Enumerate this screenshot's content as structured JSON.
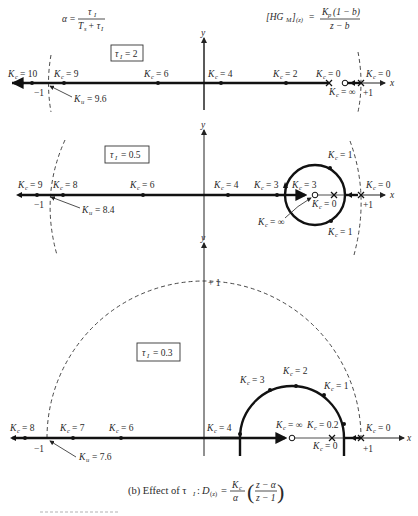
{
  "header": {
    "alpha_formula": {
      "lhs": "α =",
      "num": "τ",
      "num_sub": "I",
      "den": "T",
      "den_sub": "s",
      "den_plus": "+ τ",
      "den_sub2": "I"
    },
    "plant_formula": {
      "lhs": "[HG",
      "lhs_sub": "M",
      "lhs_close": "]",
      "lhs_sub2": "(z)",
      "eq": "=",
      "num": "K",
      "num_sub": "p",
      "num_rest": "(1 − b)",
      "den": "z − b"
    }
  },
  "axis_labels": {
    "x": "x",
    "y": "y",
    "minus_one": "−1",
    "plus_one": "+1"
  },
  "panels": [
    {
      "id": "tau-2",
      "tau_label": "τ",
      "tau_sub": "I",
      "tau_value": "= 2",
      "points": [
        {
          "label": "K",
          "sub": "c",
          "value": "= 10"
        },
        {
          "label": "K",
          "sub": "c",
          "value": "= 9"
        },
        {
          "label": "K",
          "sub": "c",
          "value": "= 6"
        },
        {
          "label": "K",
          "sub": "c",
          "value": "= 4"
        },
        {
          "label": "K",
          "sub": "c",
          "value": "= 2"
        },
        {
          "label": "K",
          "sub": "c",
          "value": "= 0"
        },
        {
          "label": "K",
          "sub": "c",
          "value": "= 0"
        },
        {
          "label": "K",
          "sub": "c",
          "value": "= ∞"
        }
      ],
      "ultimate": {
        "label": "K",
        "sub": "u",
        "value": "= 9.6"
      }
    },
    {
      "id": "tau-0.5",
      "tau_label": "τ",
      "tau_sub": "I",
      "tau_value": "= 0.5",
      "points": [
        {
          "label": "K",
          "sub": "c",
          "value": "= 9"
        },
        {
          "label": "K",
          "sub": "c",
          "value": "= 8"
        },
        {
          "label": "K",
          "sub": "c",
          "value": "= 6"
        },
        {
          "label": "K",
          "sub": "c",
          "value": "= 4"
        },
        {
          "label": "K",
          "sub": "c",
          "value": "= 3"
        },
        {
          "label": "K",
          "sub": "c",
          "value": "= 3"
        },
        {
          "label": "K",
          "sub": "c",
          "value": "= 1"
        },
        {
          "label": "K",
          "sub": "c",
          "value": "= 0"
        },
        {
          "label": "K",
          "sub": "c",
          "value": "= 0"
        },
        {
          "label": "K",
          "sub": "c",
          "value": "= 1"
        },
        {
          "label": "K",
          "sub": "c",
          "value": "= ∞"
        }
      ],
      "ultimate": {
        "label": "K",
        "sub": "u",
        "value": "= 8.4"
      }
    },
    {
      "id": "tau-0.3",
      "tau_label": "τ",
      "tau_sub": "I",
      "tau_value": "= 0.3",
      "points": [
        {
          "label": "K",
          "sub": "c",
          "value": "= 8"
        },
        {
          "label": "K",
          "sub": "c",
          "value": "= 7"
        },
        {
          "label": "K",
          "sub": "c",
          "value": "= 6"
        },
        {
          "label": "K",
          "sub": "c",
          "value": "= 4"
        },
        {
          "label": "K",
          "sub": "c",
          "value": "= 3"
        },
        {
          "label": "K",
          "sub": "c",
          "value": "= 2"
        },
        {
          "label": "K",
          "sub": "c",
          "value": "= 1"
        },
        {
          "label": "K",
          "sub": "c",
          "value": "= ∞"
        },
        {
          "label": "K",
          "sub": "c",
          "value": "= 0.2"
        },
        {
          "label": "K",
          "sub": "c",
          "value": "= 0"
        },
        {
          "label": "K",
          "sub": "c",
          "value": "= 0"
        }
      ],
      "ultimate": {
        "label": "K",
        "sub": "u",
        "value": "= 7.6"
      },
      "unit_circle_top": "+ 1"
    }
  ],
  "caption": {
    "prefix": "(b) Effect of τ",
    "prefix_sub": "I",
    "colon": ":",
    "D": "D",
    "D_sub": "(z)",
    "eq": "=",
    "frac_num": "K",
    "frac_num_sub": "c",
    "frac_den": "α",
    "paren_num": "z − α",
    "paren_den": "z − 1"
  }
}
